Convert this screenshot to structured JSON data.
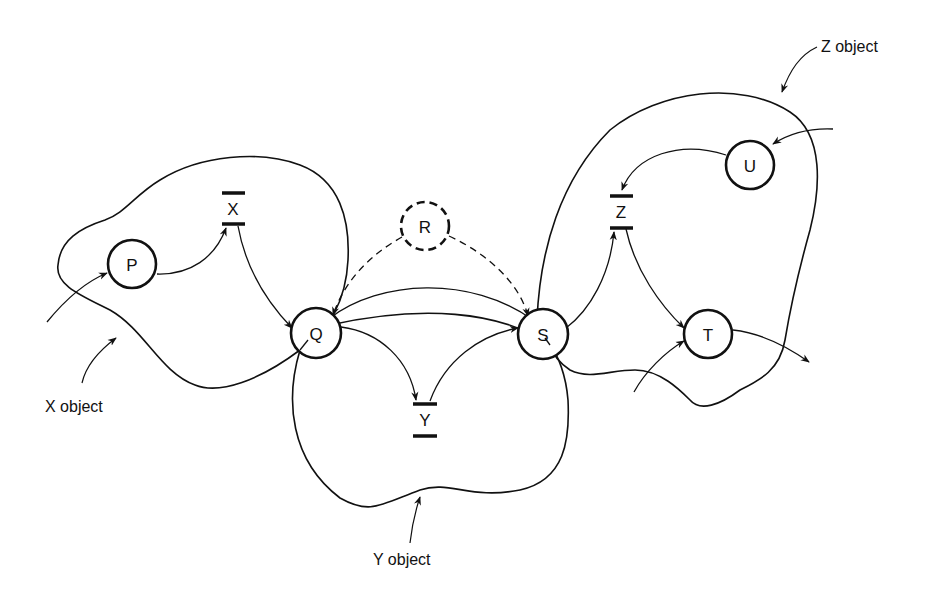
{
  "diagram": {
    "type": "object-based Petri net",
    "places": [
      {
        "id": "P",
        "label": "P",
        "style": "solid"
      },
      {
        "id": "Q",
        "label": "Q",
        "style": "solid"
      },
      {
        "id": "R",
        "label": "R",
        "style": "dashed"
      },
      {
        "id": "S",
        "label": "S",
        "style": "solid"
      },
      {
        "id": "T",
        "label": "T",
        "style": "solid"
      },
      {
        "id": "U",
        "label": "U",
        "style": "solid"
      }
    ],
    "transitions": [
      {
        "id": "X",
        "label": "X"
      },
      {
        "id": "Y",
        "label": "Y"
      },
      {
        "id": "Z",
        "label": "Z"
      }
    ],
    "objects": [
      {
        "id": "x-object",
        "label": "X object"
      },
      {
        "id": "y-object",
        "label": "Y object"
      },
      {
        "id": "z-object",
        "label": "Z object"
      }
    ],
    "arcs": [
      {
        "from": "external",
        "to": "P"
      },
      {
        "from": "P",
        "to": "X"
      },
      {
        "from": "X",
        "to": "Q"
      },
      {
        "from": "R",
        "to": "Q",
        "style": "dashed"
      },
      {
        "from": "R",
        "to": "S",
        "style": "dashed"
      },
      {
        "from": "S",
        "to": "Q"
      },
      {
        "from": "Q",
        "to": "Y"
      },
      {
        "from": "Y",
        "to": "S"
      },
      {
        "from": "S",
        "to": "Z"
      },
      {
        "from": "external",
        "to": "U"
      },
      {
        "from": "U",
        "to": "Z"
      },
      {
        "from": "Z",
        "to": "T"
      },
      {
        "from": "external",
        "to": "T"
      },
      {
        "from": "T",
        "to": "external"
      }
    ]
  }
}
